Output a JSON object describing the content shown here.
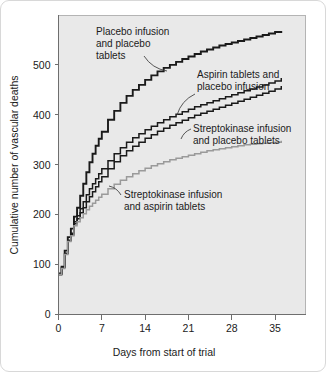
{
  "chart_data": {
    "type": "line",
    "title": "",
    "subtitle": "",
    "xlabel": "Days from start of trial",
    "ylabel": "Cumulative number of vascular deaths",
    "xlim": [
      0,
      40
    ],
    "ylim": [
      0,
      600
    ],
    "xticks": [
      0,
      7,
      14,
      21,
      28,
      35
    ],
    "xtick_labels": [
      "0",
      "7",
      "14",
      "21",
      "28",
      "35"
    ],
    "yticks": [
      0,
      100,
      200,
      300,
      400,
      500
    ],
    "ytick_labels": [
      "0",
      "100",
      "200",
      "300",
      "400",
      "500"
    ],
    "grid": false,
    "legend_position": "inline-annotations",
    "step_style": "post",
    "plot_background": "#e9e9e9",
    "series": [
      {
        "name": "Placebo infusion and placebo tablets",
        "color": "#1a1a1a",
        "width": 1.9,
        "x": [
          0,
          0.5,
          1,
          1.5,
          2,
          2.5,
          3,
          3.5,
          4,
          4.5,
          5,
          5.5,
          6,
          6.5,
          7,
          8,
          9,
          10,
          11,
          12,
          13,
          14,
          15,
          16,
          17,
          18,
          19,
          20,
          21,
          22,
          23,
          24,
          25,
          26,
          27,
          28,
          29,
          30,
          31,
          32,
          33,
          34,
          35,
          36
        ],
        "values": [
          82,
          96,
          128,
          155,
          172,
          196,
          214,
          238,
          262,
          285,
          305,
          322,
          338,
          352,
          366,
          390,
          408,
          424,
          438,
          450,
          460,
          470,
          479,
          487,
          494,
          500,
          506,
          512,
          517,
          522,
          527,
          531,
          535,
          539,
          542,
          545,
          548,
          551,
          554,
          557,
          560,
          563,
          566,
          568
        ]
      },
      {
        "name": "Aspirin tablets and placebo infusion",
        "color": "#1a1a1a",
        "width": 1.5,
        "x": [
          0,
          0.5,
          1,
          1.5,
          2,
          2.5,
          3,
          3.5,
          4,
          4.5,
          5,
          5.5,
          6,
          6.5,
          7,
          8,
          9,
          10,
          11,
          12,
          13,
          14,
          15,
          16,
          17,
          18,
          19,
          20,
          21,
          22,
          23,
          24,
          25,
          26,
          27,
          28,
          29,
          30,
          31,
          32,
          33,
          34,
          35,
          36
        ],
        "values": [
          80,
          94,
          122,
          148,
          163,
          186,
          198,
          212,
          226,
          240,
          252,
          262,
          272,
          282,
          292,
          308,
          322,
          334,
          345,
          354,
          362,
          370,
          377,
          384,
          390,
          396,
          401,
          406,
          411,
          416,
          420,
          424,
          428,
          432,
          436,
          440,
          444,
          448,
          452,
          456,
          460,
          464,
          468,
          474
        ]
      },
      {
        "name": "Streptokinase infusion and placebo tablets",
        "color": "#1a1a1a",
        "width": 1.5,
        "x": [
          0,
          0.5,
          1,
          1.5,
          2,
          2.5,
          3,
          3.5,
          4,
          4.5,
          5,
          5.5,
          6,
          6.5,
          7,
          8,
          9,
          10,
          11,
          12,
          13,
          14,
          15,
          16,
          17,
          18,
          19,
          20,
          21,
          22,
          23,
          24,
          25,
          26,
          27,
          28,
          29,
          30,
          31,
          32,
          33,
          34,
          35,
          36
        ],
        "values": [
          80,
          94,
          122,
          148,
          160,
          182,
          192,
          204,
          214,
          226,
          236,
          246,
          256,
          266,
          276,
          292,
          306,
          318,
          328,
          337,
          345,
          353,
          360,
          367,
          373,
          379,
          384,
          389,
          394,
          399,
          403,
          407,
          411,
          415,
          419,
          423,
          427,
          431,
          435,
          439,
          443,
          447,
          452,
          458
        ]
      },
      {
        "name": "Streptokinase infusion and aspirin tablets",
        "color": "#9a9a9a",
        "width": 1.5,
        "x": [
          0,
          0.5,
          1,
          1.5,
          2,
          2.5,
          3,
          3.5,
          4,
          4.5,
          5,
          5.5,
          6,
          6.5,
          7,
          8,
          9,
          10,
          11,
          12,
          13,
          14,
          15,
          16,
          17,
          18,
          19,
          20,
          21,
          22,
          23,
          24,
          25,
          26,
          27,
          28,
          29,
          30,
          31,
          32,
          33,
          34,
          35,
          36
        ],
        "values": [
          80,
          92,
          120,
          146,
          158,
          178,
          186,
          194,
          202,
          210,
          217,
          223,
          229,
          235,
          241,
          252,
          261,
          269,
          276,
          282,
          288,
          293,
          298,
          302,
          306,
          310,
          313,
          316,
          319,
          322,
          325,
          328,
          330,
          332,
          334,
          336,
          338,
          340,
          341,
          342,
          343,
          344,
          345,
          348
        ]
      }
    ],
    "annotations": [
      {
        "name": "placebo-annotation",
        "lines": [
          "Placebo infusion",
          "and placebo",
          "tablets"
        ],
        "text_x": 95,
        "text_y": 34,
        "leader_from_x": 143,
        "leader_from_y": 55,
        "leader_to_x": 166,
        "leader_to_y": 70
      },
      {
        "name": "aspirin-annotation",
        "lines": [
          "Aspirin tablets and",
          "placebo infusion"
        ],
        "text_x": 196,
        "text_y": 77,
        "leader_from_x": 194,
        "leader_from_y": 93,
        "leader_to_x": 176,
        "leader_to_y": 114
      },
      {
        "name": "streptokinase-placebo-annotation",
        "lines": [
          "Streptokinase infusion",
          "and placebo tablets"
        ],
        "text_x": 192,
        "text_y": 131,
        "leader_from_x": 190,
        "leader_from_y": 128,
        "leader_to_x": 180,
        "leader_to_y": 138
      },
      {
        "name": "streptokinase-aspirin-annotation",
        "lines": [
          "Streptokinase infusion",
          "and aspirin tablets"
        ],
        "text_x": 123,
        "text_y": 197,
        "leader_from_x": 120,
        "leader_from_y": 194,
        "leader_to_x": 108,
        "leader_to_y": 185
      }
    ]
  }
}
